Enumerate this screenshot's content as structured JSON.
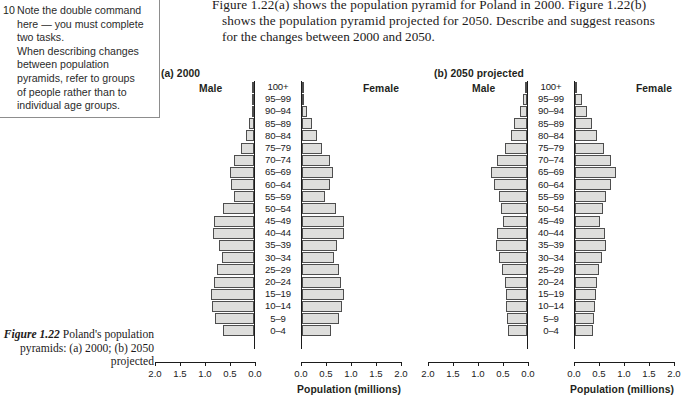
{
  "margin_note": {
    "number": "10",
    "lines": [
      "Note the double command",
      "here — you must complete",
      "two tasks.",
      "When describing changes",
      "between population",
      "pyramids, refer to groups",
      "of people rather than to",
      "individual age groups."
    ]
  },
  "question": {
    "lines": [
      "Figure 1.22(a) shows the population pyramid for Poland in 2000. Figure 1.22(b)",
      "shows the population pyramid projected for 2050. Describe and suggest reasons",
      "for the changes between 2000 and 2050."
    ]
  },
  "caption": {
    "label": "Figure 1.22",
    "text": " Poland's population pyramids: (a) 2000; (b) 2050 projected"
  },
  "axis": {
    "title": "Population (millions)",
    "ticks": [
      "2.0",
      "1.5",
      "1.0",
      "0.5",
      "0.0"
    ],
    "ticks_right": [
      "0.0",
      "0.5",
      "1.0",
      "1.5",
      "2.0"
    ],
    "max": 2.0
  },
  "labels": {
    "male": "Male",
    "female": "Female"
  },
  "chart_data": [
    {
      "type": "bar",
      "id": "a",
      "title": "(a) 2000",
      "orientation": "population-pyramid",
      "categories": [
        "100+",
        "95–99",
        "90–94",
        "85–89",
        "80–84",
        "75–79",
        "70–74",
        "65–69",
        "60–64",
        "55–59",
        "50–54",
        "45–49",
        "40–44",
        "35–39",
        "30–34",
        "25–29",
        "20–24",
        "15–19",
        "10–14",
        "5–9",
        "0–4"
      ],
      "series": [
        {
          "name": "Male",
          "values": [
            0.005,
            0.02,
            0.05,
            0.1,
            0.17,
            0.26,
            0.4,
            0.48,
            0.47,
            0.4,
            0.62,
            0.8,
            0.82,
            0.7,
            0.65,
            0.75,
            0.8,
            0.87,
            0.84,
            0.78,
            0.62
          ]
        },
        {
          "name": "Female",
          "values": [
            0.01,
            0.05,
            0.1,
            0.2,
            0.3,
            0.4,
            0.56,
            0.62,
            0.57,
            0.46,
            0.68,
            0.84,
            0.84,
            0.71,
            0.65,
            0.74,
            0.78,
            0.84,
            0.8,
            0.74,
            0.58
          ]
        }
      ],
      "xlabel": "Population (millions)",
      "ylabel": "",
      "xlim": [
        0,
        2.0
      ],
      "grid": false
    },
    {
      "type": "bar",
      "id": "b",
      "title": "(b) 2050 projected",
      "orientation": "population-pyramid",
      "categories": [
        "100+",
        "95–99",
        "90–94",
        "85–89",
        "80–84",
        "75–79",
        "70–74",
        "65–69",
        "60–64",
        "55–59",
        "50–54",
        "45–49",
        "40–44",
        "35–39",
        "30–34",
        "25–29",
        "20–24",
        "15–19",
        "10–14",
        "5–9",
        "0–4"
      ],
      "series": [
        {
          "name": "Male",
          "values": [
            0.02,
            0.08,
            0.15,
            0.26,
            0.33,
            0.45,
            0.6,
            0.72,
            0.66,
            0.57,
            0.52,
            0.48,
            0.6,
            0.63,
            0.56,
            0.5,
            0.45,
            0.43,
            0.42,
            0.4,
            0.38
          ]
        },
        {
          "name": "Female",
          "values": [
            0.05,
            0.14,
            0.24,
            0.35,
            0.44,
            0.58,
            0.72,
            0.83,
            0.72,
            0.62,
            0.56,
            0.5,
            0.6,
            0.62,
            0.55,
            0.49,
            0.44,
            0.42,
            0.41,
            0.39,
            0.37
          ]
        }
      ],
      "xlabel": "Population (millions)",
      "ylabel": "",
      "xlim": [
        0,
        2.0
      ],
      "grid": false
    }
  ]
}
